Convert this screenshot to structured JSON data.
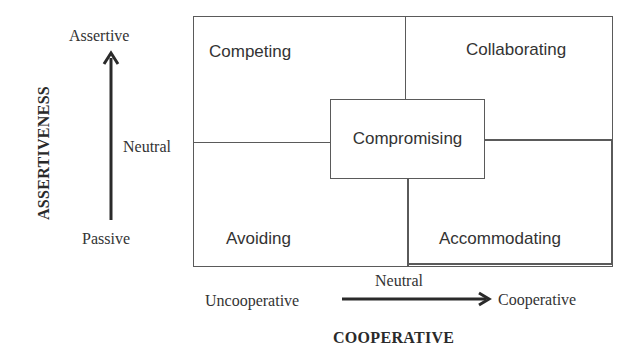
{
  "diagram": {
    "quadrants": {
      "top_left": "Competing",
      "top_right": "Collaborating",
      "bottom_left": "Avoiding",
      "bottom_right": "Accommodating",
      "center": "Compromising"
    },
    "y_axis": {
      "title": "ASSERTIVENESS",
      "top_label": "Assertive",
      "middle_label": "Neutral",
      "bottom_label": "Passive",
      "arrow_direction": "up"
    },
    "x_axis": {
      "title": "COOPERATIVE",
      "left_label": "Uncooperative",
      "middle_label": "Neutral",
      "right_label": "Cooperative",
      "arrow_direction": "right"
    },
    "colors": {
      "line": "#5a5a5a",
      "text": "#333333",
      "background": "#ffffff"
    }
  }
}
